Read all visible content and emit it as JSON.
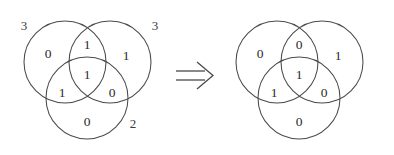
{
  "figure": {
    "type": "venn-diagram-transformation",
    "stroke_color": "#4a4a4a",
    "text_color": "#2b2b2b",
    "background_color": "#ffffff",
    "operator": {
      "name": "double-right-arrow",
      "glyph": "⟹"
    },
    "diagrams": [
      {
        "id": "left",
        "outer_labels": [
          {
            "position": "top-left",
            "text": "3"
          },
          {
            "position": "top-right",
            "text": "3"
          },
          {
            "position": "bottom-right",
            "text": "2"
          }
        ],
        "regions": [
          {
            "key": "A-only",
            "label": "left-circle-only",
            "text": "0"
          },
          {
            "key": "AB",
            "label": "left-right-intersection",
            "text": "1"
          },
          {
            "key": "B-only",
            "label": "right-circle-only",
            "text": "1"
          },
          {
            "key": "ABC",
            "label": "center-triple-intersection",
            "text": "1"
          },
          {
            "key": "AC",
            "label": "left-bottom-intersection",
            "text": "1"
          },
          {
            "key": "BC",
            "label": "right-bottom-intersection",
            "text": "0"
          },
          {
            "key": "C-only",
            "label": "bottom-circle-only",
            "text": "0"
          }
        ]
      },
      {
        "id": "right",
        "outer_labels": [],
        "regions": [
          {
            "key": "A-only",
            "label": "left-circle-only",
            "text": "0"
          },
          {
            "key": "AB",
            "label": "left-right-intersection",
            "text": "0"
          },
          {
            "key": "B-only",
            "label": "right-circle-only",
            "text": "1"
          },
          {
            "key": "ABC",
            "label": "center-triple-intersection",
            "text": "1"
          },
          {
            "key": "AC",
            "label": "left-bottom-intersection",
            "text": "1"
          },
          {
            "key": "BC",
            "label": "right-bottom-intersection",
            "text": "0"
          },
          {
            "key": "C-only",
            "label": "bottom-circle-only",
            "text": "0"
          }
        ]
      }
    ]
  }
}
